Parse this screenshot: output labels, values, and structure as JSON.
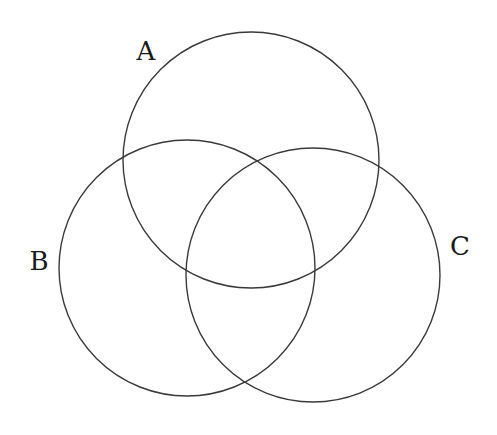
{
  "diagram": {
    "type": "venn",
    "sets": [
      {
        "id": "A",
        "label": "A",
        "cx": 251,
        "cy": 160,
        "r": 128,
        "label_x": 146,
        "label_y": 60
      },
      {
        "id": "B",
        "label": "B",
        "cx": 187,
        "cy": 268,
        "r": 128,
        "label_x": 39,
        "label_y": 270
      },
      {
        "id": "C",
        "label": "C",
        "cx": 313,
        "cy": 275,
        "r": 127,
        "label_x": 460,
        "label_y": 255
      }
    ],
    "colors": {
      "stroke": "#3a3a3a",
      "label": "#1a1a1a",
      "background": "#ffffff"
    }
  }
}
